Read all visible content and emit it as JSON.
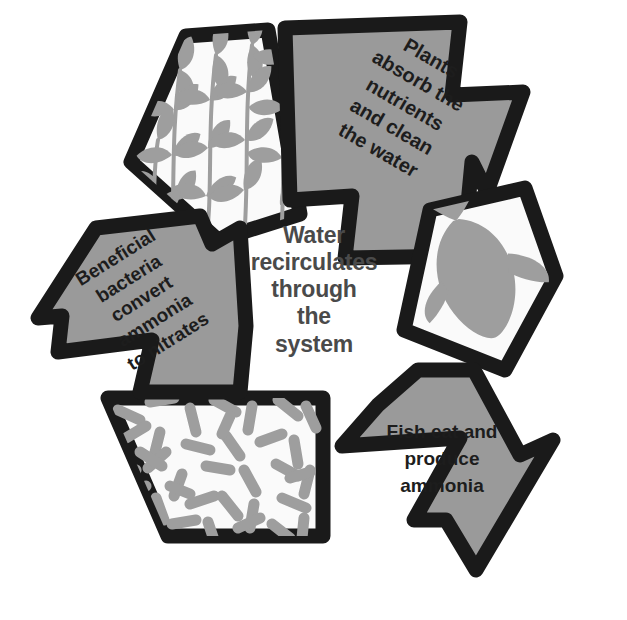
{
  "diagram": {
    "center_text": "Water\nrecirculates\nthrough\nthe\nsystem",
    "colors": {
      "outline": "#1a1a1a",
      "arrow_fill": "#9a9a9a",
      "panel_fill": "#fafafa",
      "motif_gray": "#9e9e9e",
      "center_text_color": "#4a4a4a",
      "label_text_color": "#1d1d1d",
      "background": "#ffffff"
    },
    "arrows": [
      {
        "id": "plants",
        "label": "Plants\nabsorb the\nnutrients\nand clean\nthe water",
        "direction": "down-right",
        "fill": "#9a9a9a"
      },
      {
        "id": "bacteria",
        "label": "Beneficial\nbacteria\nconvert\nammonia\nto nitrates",
        "direction": "up-right",
        "fill": "#9a9a9a"
      },
      {
        "id": "fish",
        "label": "Fish eat and\nproduce\nammonia",
        "direction": "left",
        "fill": "#9a9a9a"
      }
    ],
    "panels": [
      {
        "id": "plants-panel",
        "motif": "aquatic-plants-icon",
        "motif_label": "aquatic plants with leaves",
        "fill": "#fafafa"
      },
      {
        "id": "fish-panel",
        "motif": "fish-icon",
        "motif_label": "fish silhouette",
        "fill": "#fafafa"
      },
      {
        "id": "bacteria-panel",
        "motif": "bacteria-icon",
        "motif_label": "rod-shaped bacteria",
        "fill": "#fafafa"
      }
    ]
  }
}
